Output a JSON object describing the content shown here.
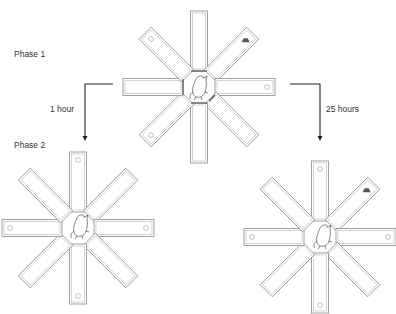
{
  "figure": {
    "labels": {
      "phase1": "Phase 1",
      "phase2": "Phase 2",
      "delay_short": "1 hour",
      "delay_long": "25 hours"
    },
    "mazes": [
      {
        "id": "phase1",
        "center": [
          199,
          87
        ],
        "arms": 8,
        "doors_closed": true,
        "food_arm": "northeast",
        "rat": true
      },
      {
        "id": "phase2-1h",
        "center": [
          78,
          228
        ],
        "arms": 8,
        "doors_closed": false,
        "food_arm": null,
        "rat": true
      },
      {
        "id": "phase2-25h",
        "center": [
          320,
          237
        ],
        "arms": 8,
        "doors_closed": false,
        "food_arm": "northeast",
        "rat": true
      }
    ],
    "colors": {
      "line": "#8a8a8a",
      "arrow": "#222222",
      "text": "#333333",
      "food": "#555555"
    }
  }
}
